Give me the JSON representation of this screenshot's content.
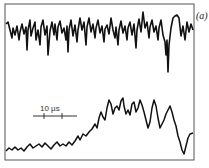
{
  "figure": {
    "panel_label": "(a)",
    "scale_bar_label": "10 µs",
    "colors": {
      "trace": "#111111",
      "frame": "#555555",
      "background": "#ffffff"
    },
    "frame": {
      "x": 5,
      "y": 4,
      "width": 189,
      "height": 156
    },
    "scale_bar": {
      "x1": 33,
      "x2": 77,
      "y": 116,
      "ticks": [
        44,
        62
      ]
    },
    "traces": [
      {
        "name": "upper-trace",
        "description": "noisy fluctuating signal, roughly stationary",
        "points": "6,24 8,22 10,30 12,38 13,28 15,35 17,26 19,40 20,32 22,24 24,34 26,27 27,50 28,30 30,20 31,36 33,28 35,22 36,40 38,30 40,45 41,27 43,20 45,35 47,26 48,55 50,31 52,22 54,35 55,24 57,40 58,27 60,21 62,33 64,28 66,40 67,26 68,52 69,30 71,20 73,36 75,25 77,42 78,30 80,18 82,30 84,22 86,45 87,27 89,18 91,32 93,24 95,38 96,28 98,20 100,33 102,26 104,42 105,29 107,25 109,34 111,18 113,30 115,38 116,27 118,45 119,30 121,21 123,33 125,26 127,40 128,28 130,22 132,35 134,24 136,48 137,30 139,19 141,32 143,12 145,28 147,22 149,38 150,27 152,20 154,32 156,26 158,40 159,28 161,20 163,35 165,42 166,55 167,40 168,72 169,45 171,28 173,18 175,16 177,15 179,18 181,36 183,26 185,40 187,22 189,32 191,24 193,30"
      },
      {
        "name": "lower-trace",
        "description": "slowly rising then fluctuating signal",
        "points": "6,151 9,148 12,150 15,147 18,150 21,148 24,151 27,147 30,144 33,148 36,146 39,144 42,147 45,143 48,146 51,149 54,145 57,142 60,146 63,144 66,146 69,142 72,145 75,141 78,136 80,140 83,134 86,136 89,132 92,129 95,124 97,128 99,118 101,112 103,117 105,120 107,108 109,100 111,104 113,114 115,108 117,106 119,110 121,101 123,98 124,106 126,114 128,110 130,115 132,104 134,102 136,112 138,108 140,100 142,105 144,112 146,120 148,128 150,122 152,108 154,100 156,106 158,118 160,128 162,124 164,120 166,114 168,110 170,106 172,112 174,120 176,126 178,136 180,142 182,150 184,154 186,146 188,138 190,134 193,133"
      }
    ]
  }
}
